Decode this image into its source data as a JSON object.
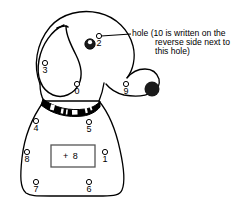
{
  "figure": {
    "line_color": "#000000",
    "fill_color": "#ffffff",
    "nose_color": "#1a1a1a",
    "collar_color": "#000000"
  },
  "holes": [
    {
      "label": "2",
      "region": "head",
      "x": 99,
      "y": 36
    },
    {
      "label": "3",
      "region": "ear",
      "x": 45,
      "y": 63
    },
    {
      "label": "0",
      "region": "head",
      "x": 77,
      "y": 84
    },
    {
      "label": "9",
      "region": "snout",
      "x": 126,
      "y": 84
    },
    {
      "label": "4",
      "region": "body",
      "x": 36,
      "y": 121
    },
    {
      "label": "5",
      "region": "body",
      "x": 89,
      "y": 122
    },
    {
      "label": "8",
      "region": "body",
      "x": 27,
      "y": 152
    },
    {
      "label": "1",
      "region": "body",
      "x": 105,
      "y": 152
    },
    {
      "label": "7",
      "region": "body",
      "x": 36,
      "y": 182
    },
    {
      "label": "6",
      "region": "body",
      "x": 89,
      "y": 182
    }
  ],
  "sum_box": {
    "label": "+ 8",
    "x": 51,
    "y": 145
  },
  "annotation": {
    "lines": [
      "hole (10 is written on the",
      "reverse side next to",
      "this hole)"
    ],
    "leader_from_hole": "2"
  }
}
